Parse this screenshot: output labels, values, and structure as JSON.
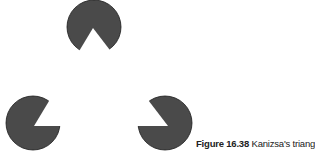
{
  "figure": {
    "label": "Figure 16.38",
    "title": "Kanizsa's triangle.",
    "disc_color": "#4a4a4a",
    "outline_color": "#1a1a1a",
    "discs": [
      {
        "name": "top",
        "cx": 94,
        "cy": 27,
        "r": 27
      },
      {
        "name": "bottom-left",
        "cx": 33,
        "cy": 123,
        "r": 27
      },
      {
        "name": "bottom-right",
        "cx": 165,
        "cy": 123,
        "r": 27
      }
    ],
    "illusory_triangle": [
      [
        93,
        28
      ],
      [
        34,
        126
      ],
      [
        168,
        126
      ]
    ]
  }
}
